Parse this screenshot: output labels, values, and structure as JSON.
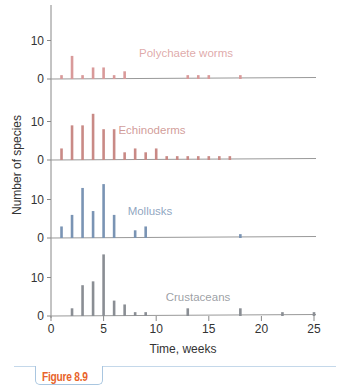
{
  "figure_label": "Figure 8.9",
  "chart_data": {
    "type": "bar",
    "title": "",
    "xlabel": "Time, weeks",
    "ylabel": "Number of species",
    "x_ticks": [
      0,
      5,
      10,
      15,
      20,
      25
    ],
    "y_ticks": [
      0,
      10
    ],
    "xlim": [
      0,
      25
    ],
    "grid": false,
    "layout": "stacked-panels-shared-x",
    "series": [
      {
        "name": "Polychaete worms",
        "color": "#d99a9a",
        "x": [
          1,
          2,
          3,
          4,
          5,
          6,
          7,
          13,
          14,
          15,
          18
        ],
        "values": [
          1,
          6,
          1,
          3,
          3,
          1,
          2,
          1,
          1,
          1,
          1
        ]
      },
      {
        "name": "Echinoderms",
        "color": "#c98a86",
        "x": [
          1,
          2,
          3,
          4,
          5,
          6,
          7,
          8,
          9,
          10,
          11,
          12,
          13,
          14,
          15,
          16,
          17
        ],
        "values": [
          3,
          9,
          9,
          12,
          8,
          8,
          2,
          3,
          2,
          3,
          1,
          1,
          1,
          1,
          1,
          1,
          1
        ]
      },
      {
        "name": "Mollusks",
        "color": "#7a94b4",
        "x": [
          1,
          2,
          3,
          4,
          5,
          6,
          8,
          9,
          18
        ],
        "values": [
          3,
          6,
          13,
          7,
          14,
          6,
          2,
          3,
          1
        ]
      },
      {
        "name": "Crustaceans",
        "color": "#8a8e94",
        "x": [
          2,
          3,
          4,
          5,
          6,
          7,
          8,
          9,
          13,
          18,
          22,
          25
        ],
        "values": [
          2,
          8,
          9,
          16,
          4,
          3,
          1,
          1,
          2,
          2,
          1,
          1
        ]
      }
    ]
  }
}
